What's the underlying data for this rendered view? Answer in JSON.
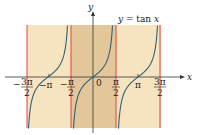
{
  "chart_data": {
    "type": "line",
    "title": "y = tan x",
    "function": "tan",
    "xlabel": "x",
    "ylabel": "y",
    "x_tick_labels": [
      "-3π/2",
      "-π",
      "-π/2",
      "0",
      "π/2",
      "π",
      "3π/2"
    ],
    "x_ticks": [
      -4.712,
      -3.1416,
      -1.5708,
      0,
      1.5708,
      3.1416,
      4.712
    ],
    "asymptotes": [
      "-3π/2",
      "-π/2",
      "π/2",
      "3π/2"
    ],
    "xlim": [
      -4.712,
      4.712
    ],
    "ylim": [
      -4.5,
      4.5
    ],
    "grid": false,
    "branches": [
      {
        "interval": [
          "-3π/2",
          "-π/2"
        ],
        "zero_at": "-π"
      },
      {
        "interval": [
          "-π/2",
          "π/2"
        ],
        "zero_at": "0"
      },
      {
        "interval": [
          "π/2",
          "3π/2"
        ],
        "zero_at": "π"
      }
    ],
    "highlighted_period": [
      "-π/2",
      "π/2"
    ],
    "colors": {
      "curve": "#2f5f78",
      "asymptote": "#e0463c",
      "background": "#f6e3bf",
      "highlight": "#e3c79a",
      "axis": "#333333"
    }
  },
  "labels": {
    "title": "y = tan x",
    "y_axis": "y",
    "x_axis": "x",
    "zero": "0",
    "neg_3pi_2": {
      "sign": "−",
      "num": "3π",
      "den": "2"
    },
    "neg_pi": "−π",
    "neg_pi_2": {
      "sign": "−",
      "num": "π",
      "den": "2"
    },
    "pi_2": {
      "num": "π",
      "den": "2"
    },
    "pi": "π",
    "pi3_2": {
      "num": "3π",
      "den": "2"
    }
  }
}
